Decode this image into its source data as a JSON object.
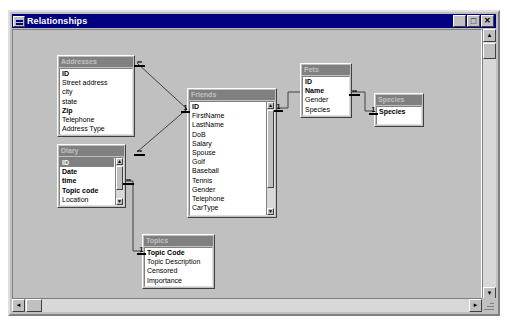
{
  "window": {
    "title": "Relationships",
    "sysmenu_icon": "system-menu-icon",
    "minimize_label": "_",
    "maximize_label": "□",
    "close_label": "✕"
  },
  "scrollbars": {
    "vertical_up": "▲",
    "vertical_down": "▼",
    "horizontal_left": "◄",
    "horizontal_right": "►"
  },
  "tables": [
    {
      "name": "Addresses",
      "fields": [
        {
          "label": "ID",
          "key": true
        },
        {
          "label": "Street address",
          "key": false
        },
        {
          "label": "city",
          "key": false
        },
        {
          "label": "state",
          "key": false
        },
        {
          "label": "Zip",
          "key": true
        },
        {
          "label": "Telephone",
          "key": false
        },
        {
          "label": "Address Type",
          "key": false
        }
      ]
    },
    {
      "name": "Diary",
      "fields": [
        {
          "label": "ID",
          "key": true,
          "selected": true
        },
        {
          "label": "Date",
          "key": true
        },
        {
          "label": "time",
          "key": true
        },
        {
          "label": "Topic code",
          "key": true
        },
        {
          "label": "Location",
          "key": false
        }
      ]
    },
    {
      "name": "Friends",
      "fields": [
        {
          "label": "ID",
          "key": true
        },
        {
          "label": "FirstName",
          "key": false
        },
        {
          "label": "LastName",
          "key": false
        },
        {
          "label": "DoB",
          "key": false
        },
        {
          "label": "Salary",
          "key": false
        },
        {
          "label": "Spouse",
          "key": false
        },
        {
          "label": "Golf",
          "key": false
        },
        {
          "label": "Baseball",
          "key": false
        },
        {
          "label": "Tennis",
          "key": false
        },
        {
          "label": "Gender",
          "key": false
        },
        {
          "label": "Telephone",
          "key": false
        },
        {
          "label": "CarType",
          "key": false
        }
      ]
    },
    {
      "name": "Pets",
      "fields": [
        {
          "label": "ID",
          "key": true
        },
        {
          "label": "Name",
          "key": true
        },
        {
          "label": "Gender",
          "key": false
        },
        {
          "label": "Species",
          "key": false
        }
      ]
    },
    {
      "name": "Species",
      "fields": [
        {
          "label": "Species",
          "key": true
        }
      ]
    },
    {
      "name": "Topics",
      "fields": [
        {
          "label": "Topic Code",
          "key": true
        },
        {
          "label": "Topic Description",
          "key": false
        },
        {
          "label": "Censored",
          "key": false
        },
        {
          "label": "Importance",
          "key": false
        }
      ]
    }
  ],
  "relationships": [
    {
      "from": "Addresses",
      "to": "Friends",
      "from_cardinality": "∞",
      "to_cardinality": "1"
    },
    {
      "from": "Diary",
      "to": "Friends",
      "from_cardinality": "∞",
      "to_cardinality": "1"
    },
    {
      "from": "Diary",
      "to": "Topics",
      "from_cardinality": "∞",
      "to_cardinality": "1"
    },
    {
      "from": "Friends",
      "to": "Pets",
      "from_cardinality": "1",
      "to_cardinality": "∞"
    },
    {
      "from": "Pets",
      "to": "Species",
      "from_cardinality": "∞",
      "to_cardinality": "1"
    }
  ],
  "colors": {
    "window_frame": "#c0c0c0",
    "title_bar": "#000080",
    "table_header": "#808080",
    "field_list_bg": "#ffffff",
    "selection": "#808080"
  }
}
